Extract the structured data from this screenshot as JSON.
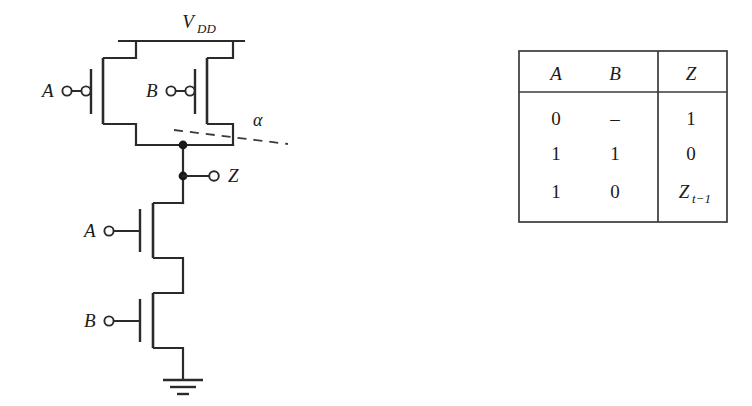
{
  "figure": {
    "type": "cmos-circuit-schematic"
  },
  "circuit": {
    "supply_label": "V",
    "supply_subscript": "DD",
    "ground_symbol": "earth-ground",
    "angle_label": "α",
    "output_label": "Z",
    "pmos": [
      {
        "id": "pmos-a",
        "input_label": "A",
        "type": "pmos",
        "inverting_bubble": true
      },
      {
        "id": "pmos-b",
        "input_label": "B",
        "type": "pmos",
        "inverting_bubble": true
      }
    ],
    "nmos": [
      {
        "id": "nmos-a",
        "input_label": "A",
        "type": "nmos",
        "inverting_bubble": false
      },
      {
        "id": "nmos-b",
        "input_label": "B",
        "type": "nmos",
        "inverting_bubble": false
      }
    ],
    "nodes": [
      {
        "id": "output-node-top",
        "label": ""
      },
      {
        "id": "output-node-z",
        "label": ""
      }
    ]
  },
  "truth_table": {
    "headers": [
      "A",
      "B",
      "Z"
    ],
    "rows": [
      {
        "a": "0",
        "b": "–",
        "z": "1",
        "z_sub": ""
      },
      {
        "a": "1",
        "b": "1",
        "z": "0",
        "z_sub": ""
      },
      {
        "a": "1",
        "b": "0",
        "z": "Z",
        "z_sub": "t−1"
      }
    ]
  },
  "colors": {
    "ink": "#1a1a1a",
    "line": "#2a2a2a",
    "table_line": "#3a3a3a",
    "background": "#ffffff"
  }
}
